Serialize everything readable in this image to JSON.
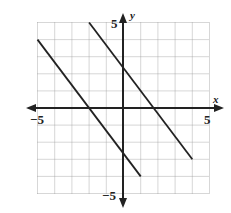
{
  "chart_data": {
    "type": "line",
    "title": "",
    "xlabel": "x",
    "ylabel": "y",
    "xlim": [
      -5,
      5
    ],
    "ylim": [
      -5,
      5
    ],
    "grid": true,
    "tick_labels": {
      "x_min": "−5",
      "x_max": "5",
      "y_min": "−5",
      "y_max": "5"
    },
    "series": [
      {
        "name": "line-1",
        "x": [
          -5,
          1
        ],
        "y": [
          4,
          -4
        ],
        "slope": -1.333
      },
      {
        "name": "line-2",
        "x": [
          -2,
          4
        ],
        "y": [
          5,
          -3
        ],
        "slope": -1.333
      }
    ]
  },
  "labels": {
    "x_axis": "x",
    "y_axis": "y",
    "x_min": "−5",
    "x_max": "5",
    "y_min": "−5",
    "y_max": "5"
  }
}
